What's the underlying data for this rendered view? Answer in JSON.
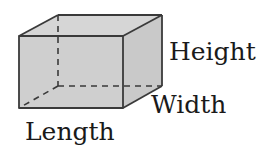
{
  "diagram": {
    "type": "rectangular-prism",
    "fill_color": "#cfcfcf",
    "edge_color": "#3a3a3a",
    "hidden_edge_style": "dashed",
    "labels": {
      "height": "Height",
      "width": "Width",
      "length": "Length"
    }
  }
}
